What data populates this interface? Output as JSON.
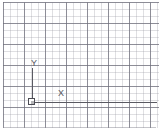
{
  "viewport": {
    "name": "cad-grid-viewport",
    "width": 159,
    "height": 135,
    "background_color": "#ffffff"
  },
  "grid": {
    "minor_spacing_px": 7,
    "major_spacing_px": 21,
    "minor_color": "#96969f",
    "major_color": "#6e6e7a",
    "visible": true
  },
  "frame": {
    "rule_color": "#8c8c96",
    "top_rule": true,
    "bottom_rule": true
  },
  "ucs": {
    "origin_x": 31,
    "origin_y": 100,
    "marker_style": "square",
    "marker_color": "#4c4c54",
    "axis_color": "#5a5a62",
    "y_axis": {
      "label": "Y",
      "length_px": 34,
      "direction": "up"
    },
    "x_axis": {
      "label": "X",
      "length_px": 125,
      "direction": "right"
    }
  }
}
